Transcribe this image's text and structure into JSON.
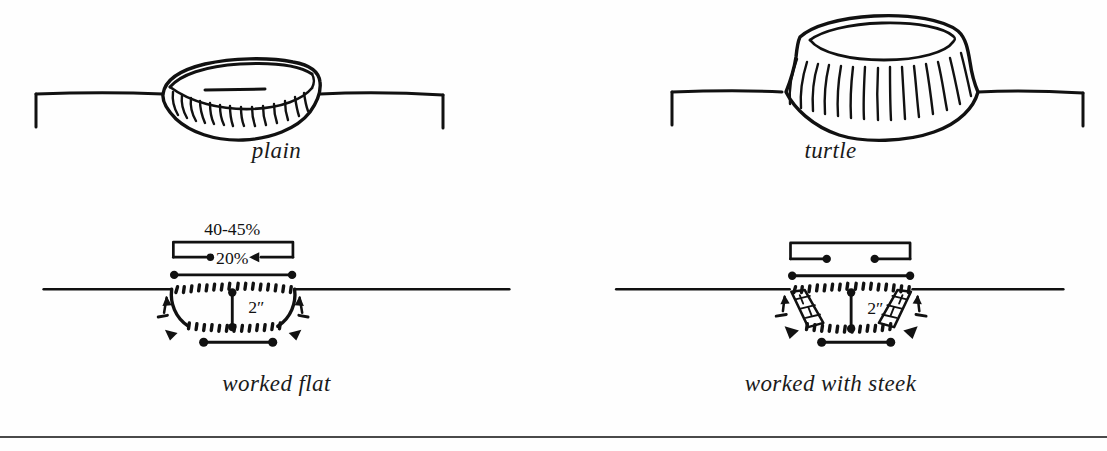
{
  "figure": {
    "background_color": "#fefefe",
    "ink_color": "#111111",
    "rule_color": "#4a4a4a",
    "panels": [
      {
        "id": "plain",
        "caption": "plain",
        "kind": "finished-neckline-front-view",
        "description": "plain rolled neckband on shoulder line"
      },
      {
        "id": "turtle",
        "caption": "turtle",
        "kind": "finished-neckline-front-view",
        "description": "tall turtleneck collar on shoulder line"
      },
      {
        "id": "worked-flat",
        "caption": "worked flat",
        "kind": "schematic-measurements",
        "description": "neckline shaping worked flat with shaping arrows"
      },
      {
        "id": "worked-steek",
        "caption": "worked with steek",
        "kind": "schematic-measurements",
        "description": "neckline shaping worked in the round with steeks at each side"
      }
    ]
  },
  "measurements": {
    "worked_flat": {
      "total_width_label": "40-45%",
      "base_width_label": "20%",
      "depth_label": "2″"
    },
    "worked_steek": {
      "total_width_label": "",
      "base_width_label": "",
      "depth_label": "2″"
    }
  },
  "icons": {
    "shoulder_line": "horizontal-shoulder-line",
    "bracket": "measurement-bracket",
    "arrow_in": "inward-arrow",
    "arrow_up": "shaping-arrow-up",
    "dot_end": "measurement-dot",
    "steek": "steek-hatched-panel",
    "triangle": "bind-off-triangle"
  }
}
